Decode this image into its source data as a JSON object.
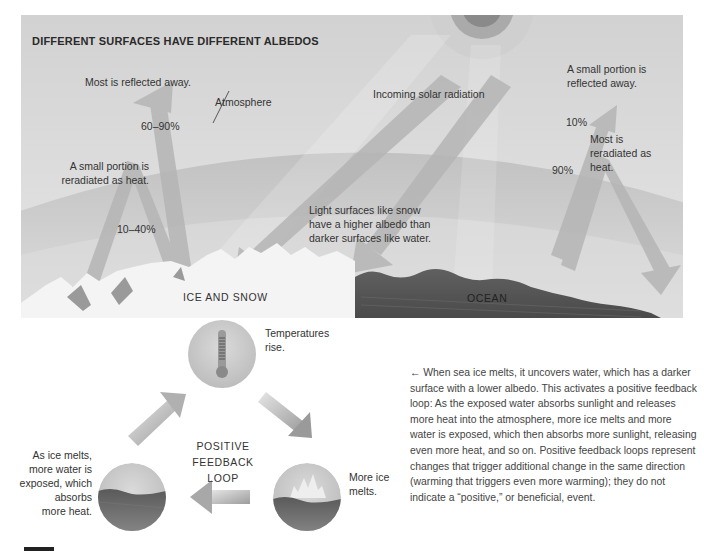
{
  "figure": {
    "title": "DIFFERENT SURFACES HAVE DIFFERENT ALBEDOS",
    "labels": {
      "most_reflected": "Most is reflected away.",
      "atmosphere": "Atmosphere",
      "pct_60_90": "60–90%",
      "incoming": "Incoming solar radiation",
      "small_reflected_1": "A small portion is",
      "small_reflected_2": "reflected away.",
      "pct_10": "10%",
      "small_reradiated_1": "A small portion is",
      "small_reradiated_2": "reradiated as heat.",
      "pct_10_40": "10–40%",
      "light_surfaces_1": "Light surfaces like snow",
      "light_surfaces_2": "have a higher albedo than",
      "light_surfaces_3": "darker surfaces like water.",
      "most_reradiated_1": "Most is",
      "most_reradiated_2": "reradiated as",
      "most_reradiated_3": "heat.",
      "pct_90": "90%",
      "ice_and_snow": "ICE AND SNOW",
      "ocean": "OCEAN"
    },
    "colors": {
      "sky": "#d6d6d6",
      "atmosphere": "#c2c2c2",
      "arrow": "#b8b8b8",
      "sun_core": "#8a8a8a",
      "sun_ring": "#aaaaaa",
      "ocean": "#555555",
      "snow": "#f4f4f4"
    }
  },
  "loop": {
    "title_1": "POSITIVE FEEDBACK",
    "title_2": "LOOP",
    "steps": [
      {
        "icon": "thermometer-icon",
        "text_1": "Temperatures",
        "text_2": "rise."
      },
      {
        "icon": "melting-ice-icon",
        "text_1": "More ice",
        "text_2": "melts."
      },
      {
        "icon": "exposed-water-icon",
        "text_1": "As ice melts,",
        "text_2": "more water is",
        "text_3": "exposed, which",
        "text_4": "absorbs",
        "text_5": "more heat."
      }
    ]
  },
  "caption": {
    "arrow": "←",
    "text": "When sea ice melts, it uncovers water, which has a darker surface with a lower albedo. This activates a positive feedback loop: As the exposed water absorbs sunlight and releases more heat into the atmosphere, more ice melts and more water is exposed, which then absorbs more sunlight, releasing even more heat, and so on. Positive feedback loops represent changes that trigger additional change in the same direction (warming that triggers even more warming); they do not indicate a “positive,” or beneficial, event."
  }
}
